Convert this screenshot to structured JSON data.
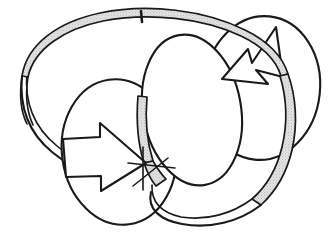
{
  "figure": {
    "type": "line-diagram",
    "background_color": "#ffffff",
    "ink_color": "#1a1a1a",
    "shade_color": "#d9d9d9",
    "canvas": {
      "width": 330,
      "height": 237
    },
    "elements": {
      "band": {
        "name": "twisted-ribbon",
        "description": "Large elliptical ribbon looping from upper left, around the right side and under the bottom",
        "shaded": true,
        "shade_color": "#d9d9d9",
        "edge_color": "#1a1a1a"
      },
      "tick": {
        "name": "band-tick-mark",
        "description": "Short vertical mark crossing the ribbon at the top",
        "position": {
          "x": 141,
          "y": 16
        },
        "length": 11
      },
      "left_circle": {
        "name": "left-circle",
        "center": {
          "x": 119,
          "y": 152
        },
        "radius_x": 57,
        "radius_y": 73,
        "rotation": -8
      },
      "right_circle": {
        "name": "right-circle",
        "center": {
          "x": 262,
          "y": 88
        },
        "radius_x": 58,
        "radius_y": 72,
        "rotation": 6
      },
      "center_ellipse": {
        "name": "center-ellipse",
        "center": {
          "x": 192,
          "y": 110
        },
        "radius_x": 49,
        "radius_y": 76,
        "rotation": -10
      },
      "left_arrow": {
        "name": "left-arrow-marker",
        "direction": "right",
        "description": "Block arrow on the left circle pointing right"
      },
      "right_arrow": {
        "name": "right-arrow-marker",
        "direction": "up-right",
        "description": "Chevron arrowhead on the right circle pointing up and to the right"
      }
    }
  }
}
